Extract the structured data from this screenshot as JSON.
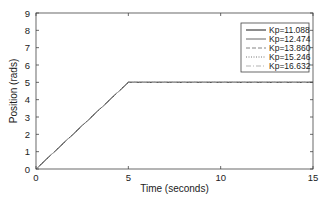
{
  "chart_data": {
    "type": "line",
    "title": "",
    "xlabel": "Time (seconds)",
    "ylabel": "Position (rads)",
    "xlim": [
      0,
      15
    ],
    "ylim": [
      0,
      9
    ],
    "xticks": [
      0,
      5,
      10,
      15
    ],
    "yticks": [
      0,
      1,
      2,
      3,
      4,
      5,
      6,
      7,
      8,
      9
    ],
    "grid": false,
    "legend_position": "upper right",
    "series": [
      {
        "name": "Kp=11.088",
        "style": "solid",
        "color": "#000000",
        "x": [
          0,
          5,
          15
        ],
        "y": [
          0,
          5,
          5
        ]
      },
      {
        "name": "Kp=12.474",
        "style": "solid",
        "color": "#555555",
        "x": [
          0,
          5,
          15
        ],
        "y": [
          0,
          5,
          5
        ]
      },
      {
        "name": "Kp=13.860",
        "style": "dashed",
        "color": "#777777",
        "x": [
          0,
          5,
          15
        ],
        "y": [
          0,
          5,
          5
        ]
      },
      {
        "name": "Kp=15.246",
        "style": "dotted",
        "color": "#666666",
        "x": [
          0,
          5,
          15
        ],
        "y": [
          0,
          5,
          5
        ]
      },
      {
        "name": "Kp=16.632",
        "style": "dashdot",
        "color": "#aaaaaa",
        "x": [
          0,
          5,
          15
        ],
        "y": [
          0,
          5,
          5
        ]
      }
    ]
  }
}
